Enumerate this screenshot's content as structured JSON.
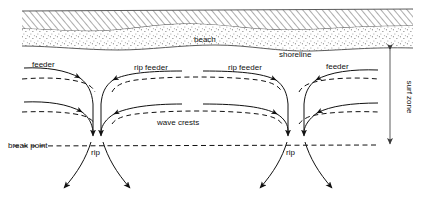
{
  "figure": {
    "background_color": "#ffffff",
    "ink_color": "#111111"
  },
  "labels": {
    "beach": "beach",
    "shoreline": "shoreline",
    "feeder_left": "feeder",
    "rip_feeder_left": "rip feeder",
    "rip_feeder_right": "rip feeder",
    "feeder_right": "feeder",
    "wave_crests": "wave crests",
    "break_point": "break point",
    "rip_left": "rip",
    "rip_right": "rip",
    "surf_zone": "surf zone"
  },
  "regions": {
    "dune": {
      "name": "hatched-land",
      "pattern": "diagonal-hatch"
    },
    "beach": {
      "name": "stippled-beach",
      "pattern": "stipple-dots"
    },
    "water": {
      "name": "open-water",
      "pattern": "none"
    }
  },
  "features": {
    "wave_crest_lines": 4,
    "rip_channels": 2,
    "feeder_currents": 4,
    "rip_head_arrows": 4,
    "surf_zone_marker": "double-headed-vertical-arrow"
  }
}
